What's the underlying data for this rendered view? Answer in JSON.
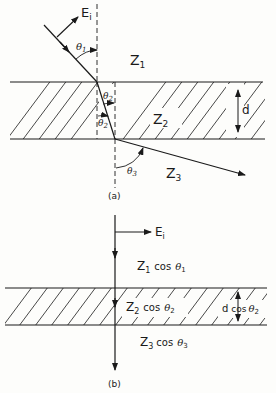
{
  "figure_a": {
    "caption": "(a)",
    "incident_field_label": "E",
    "incident_field_sub": "i",
    "media": [
      {
        "name": "Z",
        "sub": "1"
      },
      {
        "name": "Z",
        "sub": "2"
      },
      {
        "name": "Z",
        "sub": "3"
      }
    ],
    "angles": [
      {
        "symbol": "θ",
        "sub": "1"
      },
      {
        "symbol": "θ",
        "sub": "2"
      },
      {
        "symbol": "θ",
        "sub": "2"
      },
      {
        "symbol": "θ",
        "sub": "3"
      }
    ],
    "thickness_label": "d"
  },
  "figure_b": {
    "caption": "(b)",
    "incident_field_label": "E",
    "incident_field_sub": "i",
    "media": [
      {
        "name": "Z",
        "sub": "1",
        "cos": "cos",
        "angle": "θ",
        "angle_sub": "1"
      },
      {
        "name": "Z",
        "sub": "2",
        "cos": "cos",
        "angle": "θ",
        "angle_sub": "2"
      },
      {
        "name": "Z",
        "sub": "3",
        "cos": "cos",
        "angle": "θ",
        "angle_sub": "3"
      }
    ],
    "thickness_label": "d",
    "thickness_cos": "cos",
    "thickness_angle": "θ",
    "thickness_angle_sub": "2"
  },
  "colors": {
    "ink": "#1a1a1a",
    "paper": "#fdfdfb"
  }
}
